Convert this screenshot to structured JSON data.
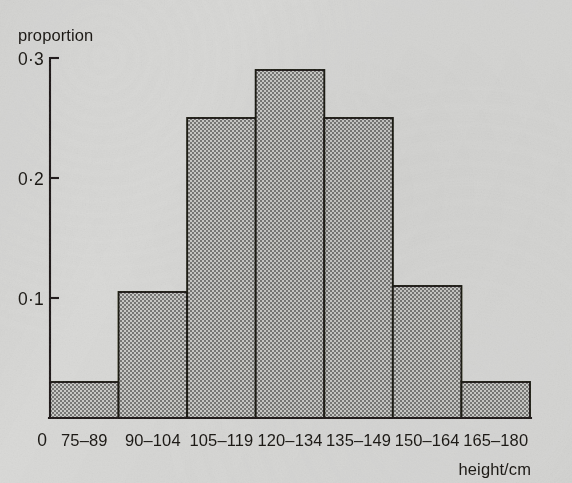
{
  "chart_data": {
    "type": "bar",
    "title": "",
    "subtitle": "",
    "ylabel": "proportion",
    "xlabel": "height/cm",
    "categories": [
      "75–89",
      "90–104",
      "105–119",
      "120–134",
      "135–149",
      "150–164",
      "165–180"
    ],
    "values": [
      0.03,
      0.105,
      0.25,
      0.29,
      0.25,
      0.11,
      0.03
    ],
    "ylim": [
      0,
      0.3
    ],
    "y_ticks": [
      "0",
      "0·1",
      "0·2",
      "0·3"
    ],
    "y_tick_values": [
      0,
      0.1,
      0.2,
      0.3
    ],
    "grid": false,
    "legend": false,
    "legend_position": "none",
    "bar_fill": "#9a9a98",
    "bar_stroke": "#181511",
    "background": "#d8d8d6"
  },
  "axes": {
    "y_axis_title": "proportion",
    "x_axis_title": "height/cm",
    "origin_label": "0"
  }
}
